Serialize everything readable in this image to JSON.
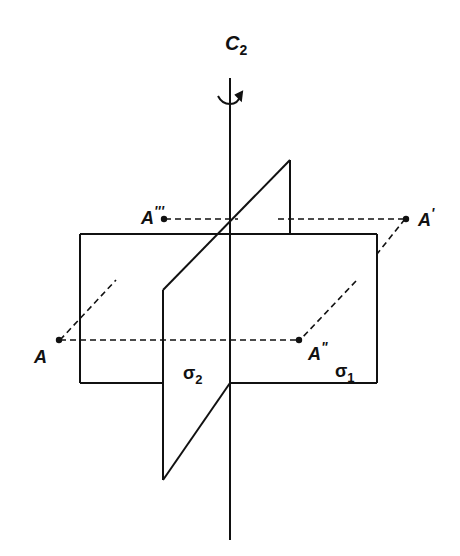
{
  "figure": {
    "axis": {
      "label": "C",
      "subscript": "2",
      "rotation_arrow": "rotation-arrow"
    },
    "planes": [
      {
        "id": "sigma1",
        "label": "σ",
        "subscript": "1",
        "description": "horizontal plane"
      },
      {
        "id": "sigma2",
        "label": "σ",
        "subscript": "2",
        "description": "vertical plane"
      }
    ],
    "points": [
      {
        "id": "A",
        "label": "A",
        "primes": ""
      },
      {
        "id": "A1",
        "label": "A",
        "primes": "'"
      },
      {
        "id": "A2",
        "label": "A",
        "primes": "\""
      },
      {
        "id": "A3",
        "label": "A",
        "primes": "'''"
      }
    ],
    "colors": {
      "ink": "#111111",
      "background": "#ffffff"
    }
  }
}
